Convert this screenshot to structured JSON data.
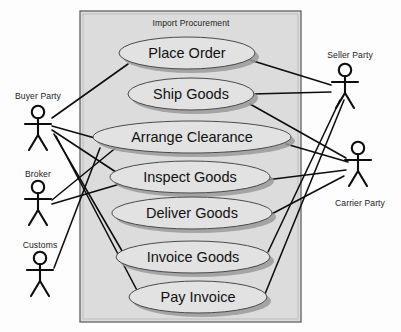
{
  "diagram": {
    "kind": "uml-use-case-diagram",
    "system_boundary": {
      "title": "Import Procurement",
      "x": 80,
      "y": 11,
      "width": 221,
      "height": 311,
      "fill": "#dcdcdc",
      "stroke": "#6b6b6b"
    },
    "use_cases": [
      {
        "id": "place-order",
        "label": "Place Order",
        "cx": 187,
        "cy": 53,
        "rx": 68,
        "ry": 16
      },
      {
        "id": "ship-goods",
        "label": "Ship Goods",
        "cx": 191,
        "cy": 94,
        "rx": 63,
        "ry": 16
      },
      {
        "id": "arrange-clearance",
        "label": "Arrange Clearance",
        "cx": 192,
        "cy": 137,
        "rx": 99,
        "ry": 16
      },
      {
        "id": "inspect-goods",
        "label": "Inspect Goods",
        "cx": 190,
        "cy": 177,
        "rx": 80,
        "ry": 16
      },
      {
        "id": "deliver-goods",
        "label": "Deliver Goods",
        "cx": 192,
        "cy": 213,
        "rx": 80,
        "ry": 16
      },
      {
        "id": "invoice-goods",
        "label": "Invoice Goods",
        "cx": 193,
        "cy": 257,
        "rx": 77,
        "ry": 16
      },
      {
        "id": "pay-invoice",
        "label": "Pay Invoice",
        "cx": 198,
        "cy": 297,
        "rx": 69,
        "ry": 16
      }
    ],
    "actors": [
      {
        "id": "buyer-party",
        "label": "Buyer Party",
        "x": 38,
        "y": 112,
        "label_x": 38,
        "label_y": 99,
        "label_position": "above"
      },
      {
        "id": "broker",
        "label": "Broker",
        "x": 38,
        "y": 187,
        "label_x": 38,
        "label_y": 177,
        "label_position": "above"
      },
      {
        "id": "customs",
        "label": "Customs",
        "x": 40,
        "y": 258,
        "label_x": 40,
        "label_y": 248,
        "label_position": "above"
      },
      {
        "id": "seller-party",
        "label": "Seller Party",
        "x": 345,
        "y": 70,
        "label_x": 350,
        "label_y": 58,
        "label_position": "above"
      },
      {
        "id": "carrier-party",
        "label": "Carrier Party",
        "x": 358,
        "y": 148,
        "label_x": 360,
        "label_y": 206,
        "label_position": "below"
      }
    ],
    "associations": [
      {
        "from": "buyer-party",
        "to": "place-order",
        "x1": 52,
        "y1": 118,
        "x2": 128,
        "y2": 64
      },
      {
        "from": "buyer-party",
        "to": "arrange-clearance",
        "x1": 52,
        "y1": 126,
        "x2": 102,
        "y2": 140
      },
      {
        "from": "buyer-party",
        "to": "inspect-goods",
        "x1": 52,
        "y1": 130,
        "x2": 128,
        "y2": 180
      },
      {
        "from": "buyer-party",
        "to": "invoice-goods",
        "x1": 54,
        "y1": 134,
        "x2": 125,
        "y2": 256
      },
      {
        "from": "buyer-party",
        "to": "pay-invoice",
        "x1": 56,
        "y1": 136,
        "x2": 140,
        "y2": 296
      },
      {
        "from": "broker",
        "to": "arrange-clearance",
        "x1": 52,
        "y1": 200,
        "x2": 118,
        "y2": 146
      },
      {
        "from": "broker",
        "to": "inspect-goods",
        "x1": 52,
        "y1": 204,
        "x2": 120,
        "y2": 184
      },
      {
        "from": "customs",
        "to": "arrange-clearance",
        "x1": 54,
        "y1": 268,
        "x2": 100,
        "y2": 148
      },
      {
        "from": "seller-party",
        "to": "place-order",
        "x1": 331,
        "y1": 85,
        "x2": 250,
        "y2": 60
      },
      {
        "from": "seller-party",
        "to": "ship-goods",
        "x1": 331,
        "y1": 92,
        "x2": 252,
        "y2": 94
      },
      {
        "from": "seller-party",
        "to": "invoice-goods",
        "x1": 340,
        "y1": 100,
        "x2": 268,
        "y2": 252
      },
      {
        "from": "seller-party",
        "to": "pay-invoice",
        "x1": 344,
        "y1": 100,
        "x2": 265,
        "y2": 294
      },
      {
        "from": "carrier-party",
        "to": "ship-goods",
        "x1": 346,
        "y1": 158,
        "x2": 250,
        "y2": 104
      },
      {
        "from": "carrier-party",
        "to": "arrange-clearance",
        "x1": 348,
        "y1": 162,
        "x2": 286,
        "y2": 144
      },
      {
        "from": "carrier-party",
        "to": "inspect-goods",
        "x1": 346,
        "y1": 170,
        "x2": 266,
        "y2": 180
      },
      {
        "from": "carrier-party",
        "to": "deliver-goods",
        "x1": 344,
        "y1": 176,
        "x2": 264,
        "y2": 218
      }
    ]
  }
}
